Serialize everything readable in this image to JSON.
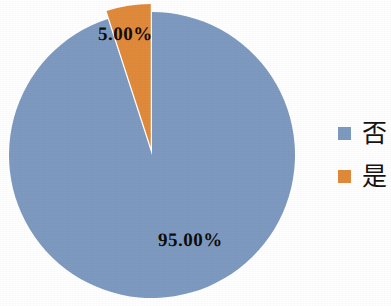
{
  "chart_data": {
    "type": "pie",
    "title": "",
    "labels": [
      "否",
      "是"
    ],
    "values": [
      95.0,
      5.0
    ],
    "value_labels": [
      "95.00%",
      "5.00%"
    ],
    "colors": [
      "#7e9ac0",
      "#e08a3c"
    ],
    "legend_position": "right",
    "grid": false,
    "start_angle_deg": 0,
    "direction": "clockwise",
    "exploded_slices": [
      "是"
    ],
    "slices": [
      {
        "name": "否",
        "value": 95.0,
        "value_label": "95.00%",
        "color": "#7e9ac0",
        "exploded": false
      },
      {
        "name": "是",
        "value": 5.0,
        "value_label": "5.00%",
        "color": "#e08a3c",
        "exploded": true
      }
    ]
  },
  "legend": {
    "items": [
      {
        "label": "否",
        "color": "#7e9ac0",
        "swatch_name": "legend-swatch-no"
      },
      {
        "label": "是",
        "color": "#e08a3c",
        "swatch_name": "legend-swatch-yes"
      }
    ]
  },
  "labels": {
    "yes_percent": "5.00%",
    "no_percent": "95.00%"
  }
}
